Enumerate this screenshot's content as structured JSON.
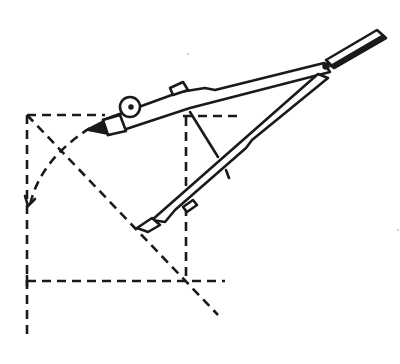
{
  "figure": {
    "colors": {
      "ink": "#1a1a1a",
      "background": "#ffffff"
    },
    "elements": [
      {
        "name": "dashed-square",
        "type": "construction-line"
      },
      {
        "name": "dashed-diagonal",
        "type": "construction-line"
      },
      {
        "name": "dashed-arc",
        "type": "construction-line"
      },
      {
        "name": "dashed-horizontal-extension",
        "type": "construction-line"
      },
      {
        "name": "compass",
        "type": "instrument"
      }
    ]
  }
}
